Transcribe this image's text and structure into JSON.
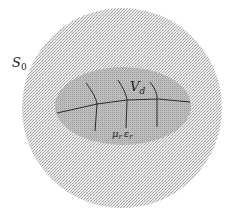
{
  "diagram": {
    "outer_region": {
      "label": "S",
      "subscript": "0"
    },
    "inner_region": {
      "label": "V",
      "subscript": "d"
    },
    "material": {
      "mu": "μ",
      "mu_sub": "r",
      "eps": "ε",
      "eps_sub": "r"
    },
    "colors": {
      "outer_fill": "#dcdcdc",
      "inner_fill": "#b5b5b5",
      "lines": "#2a2a2a"
    }
  }
}
